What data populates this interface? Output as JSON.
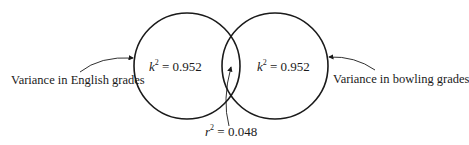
{
  "diagram": {
    "type": "venn",
    "circles": [
      {
        "id": "english",
        "label": "Variance in English grades",
        "value_var": "k",
        "value_exp": "2",
        "value_text": "= 0.952"
      },
      {
        "id": "bowling",
        "label": "Variance in bowling grades",
        "value_var": "k",
        "value_exp": "2",
        "value_text": "= 0.952"
      }
    ],
    "overlap": {
      "var": "r",
      "exp": "2",
      "text": "= 0.048"
    },
    "colors": {
      "stroke": "#1a1a1a",
      "background": "#ffffff"
    }
  }
}
